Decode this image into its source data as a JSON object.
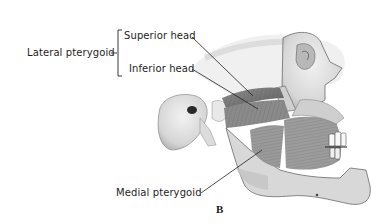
{
  "figure": {
    "panel_letter": "B",
    "labels": {
      "group": "Lateral pterygoid",
      "superior_head": "Superior head",
      "inferior_head": "Inferior head",
      "medial": "Medial pterygoid"
    }
  },
  "colors": {
    "background": "#ffffff",
    "text": "#1e1e1e",
    "leader_line": "#222222",
    "bone_light": "#e6e6e6",
    "bone_mid": "#bdbdbd",
    "muscle_dark": "#7a7a7a",
    "shadow": "#3a3a3a"
  }
}
